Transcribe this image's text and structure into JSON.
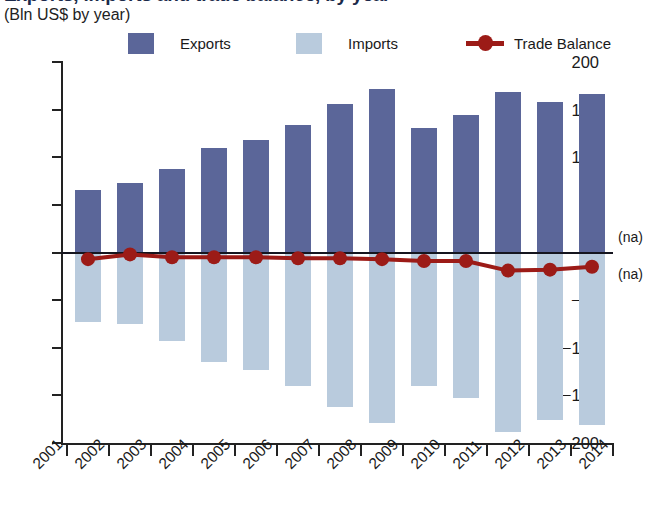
{
  "header": {
    "title": "Exports, imports and trade balance, by year",
    "subtitle": "(Bln US$ by year)"
  },
  "legend": {
    "items": [
      {
        "key": "exports",
        "label": "Exports",
        "color": "#5b6699",
        "marker": "square"
      },
      {
        "key": "imports",
        "label": "Imports",
        "color": "#b9cbdd",
        "marker": "square"
      },
      {
        "key": "balance",
        "label": "Trade Balance",
        "color": "#9c1b17",
        "marker": "line-dot"
      }
    ]
  },
  "annotations": {
    "na_top": "(na)",
    "na_bottom": "(na)"
  },
  "chart_data": {
    "type": "bar",
    "title": "Exports, imports and trade balance, by year",
    "subtitle": "(Bln US$ by year)",
    "xlabel": "",
    "ylabel": "Bln US$",
    "ylim": [
      -200,
      200
    ],
    "yticks": [
      200,
      150,
      100,
      50,
      0,
      -50,
      -100,
      -150,
      -200
    ],
    "ytick_labels": [
      "200",
      "150",
      "100",
      "50",
      "0",
      "−50",
      "−100",
      "−150",
      "−200"
    ],
    "xticks": [
      "2001",
      "2002",
      "2003",
      "2004",
      "2005",
      "2006",
      "2007",
      "2008",
      "2009",
      "2010",
      "2011",
      "2012",
      "2013",
      "2014"
    ],
    "categories": [
      "2001",
      "2002",
      "2003",
      "2004",
      "2005",
      "2006",
      "2007",
      "2008",
      "2009",
      "2010",
      "2011",
      "2012",
      "2013"
    ],
    "grid": false,
    "legend_position": "top",
    "series": [
      {
        "name": "Exports",
        "type": "bar",
        "color": "#5b6699",
        "values": [
          66,
          73,
          88,
          110,
          118,
          134,
          156,
          172,
          131,
          144,
          169,
          158,
          166
        ]
      },
      {
        "name": "Imports",
        "type": "bar",
        "color": "#b9cbdd",
        "values": [
          -73,
          -75,
          -93,
          -115,
          -123,
          -140,
          -162,
          -179,
          -140,
          -153,
          -188,
          -176,
          -181
        ]
      },
      {
        "name": "Trade Balance",
        "type": "line",
        "color": "#9c1b17",
        "values": [
          -7,
          -2,
          -5,
          -5,
          -5,
          -6,
          -6,
          -7,
          -9,
          -9,
          -19,
          -18,
          -15
        ]
      }
    ]
  }
}
